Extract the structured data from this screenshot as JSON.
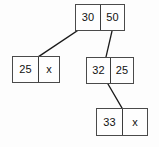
{
  "diagram": {
    "type": "linked-node-tree",
    "colors": {
      "background": "#fdfdfd",
      "node_fill": "#fefefe",
      "node_border": "#4a4a4a",
      "divider": "#3c3c3c",
      "edge": "#1a1a1a",
      "text": "#111111"
    },
    "nodes": [
      {
        "id": "root",
        "left_value": "30",
        "right_value": "50",
        "x": 75,
        "y": 4,
        "width": 50,
        "height": 27,
        "split": 25
      },
      {
        "id": "left-child",
        "left_value": "25",
        "right_value": "x",
        "x": 12,
        "y": 56,
        "width": 48,
        "height": 27,
        "split": 26
      },
      {
        "id": "right-child",
        "left_value": "32",
        "right_value": "25",
        "x": 86,
        "y": 57,
        "width": 48,
        "height": 27,
        "split": 24
      },
      {
        "id": "grandchild",
        "left_value": "33",
        "right_value": "x",
        "x": 96,
        "y": 108,
        "width": 52,
        "height": 28,
        "split": 26
      }
    ],
    "edges": [
      {
        "id": "root-to-left-child",
        "from_node": "root",
        "to_node": "left-child",
        "x1": 77,
        "y1": 31,
        "x2": 38,
        "y2": 57
      },
      {
        "id": "root-to-right-child",
        "from_node": "root",
        "to_node": "right-child",
        "x1": 112,
        "y1": 31,
        "x2": 106,
        "y2": 57
      },
      {
        "id": "right-child-to-grandchild",
        "from_node": "right-child",
        "to_node": "grandchild",
        "x1": 108,
        "y1": 84,
        "x2": 122,
        "y2": 108
      }
    ]
  }
}
